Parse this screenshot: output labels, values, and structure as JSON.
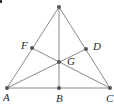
{
  "diagram": {
    "type": "triangle-medians",
    "colors": {
      "line": "#8a8a8a",
      "point": "#555555",
      "label": "#2a2a2a"
    },
    "points": {
      "apex": {
        "label": "",
        "x": 59,
        "y": 7
      },
      "A": {
        "label": "A",
        "x": 7,
        "y": 88,
        "lx": 3,
        "ly": 101
      },
      "B": {
        "label": "B",
        "x": 59,
        "y": 88,
        "lx": 56,
        "ly": 102
      },
      "C": {
        "label": "C",
        "x": 110,
        "y": 88,
        "lx": 106,
        "ly": 102
      },
      "F": {
        "label": "F",
        "x": 32,
        "y": 48,
        "lx": 21,
        "ly": 49
      },
      "D": {
        "label": "D",
        "x": 86,
        "y": 49,
        "lx": 93,
        "ly": 50
      },
      "G": {
        "label": "G",
        "x": 59,
        "y": 62,
        "lx": 67,
        "ly": 65
      }
    },
    "segments": [
      [
        "apex",
        "A"
      ],
      [
        "apex",
        "C"
      ],
      [
        "A",
        "C"
      ],
      [
        "apex",
        "B"
      ],
      [
        "A",
        "D"
      ],
      [
        "C",
        "F"
      ]
    ]
  }
}
